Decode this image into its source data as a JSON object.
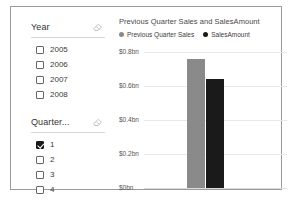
{
  "report": {
    "frame_border_color": "#9b9b9b",
    "background": "#ffffff"
  },
  "slicers": [
    {
      "id": "year-slicer",
      "title": "Year",
      "clear_icon": "eraser-icon",
      "items": [
        {
          "label": "2005",
          "checked": false
        },
        {
          "label": "2006",
          "checked": false
        },
        {
          "label": "2007",
          "checked": false
        },
        {
          "label": "2008",
          "checked": false
        }
      ]
    },
    {
      "id": "quarter-slicer",
      "title": "Quarter...",
      "clear_icon": "eraser-icon",
      "items": [
        {
          "label": "1",
          "checked": true
        },
        {
          "label": "2",
          "checked": false
        },
        {
          "label": "3",
          "checked": false
        },
        {
          "label": "4",
          "checked": false
        }
      ]
    }
  ],
  "chart_data": {
    "type": "bar",
    "title": "Previous Quarter Sales and SalesAmount",
    "xlabel": "",
    "ylabel": "",
    "categories": [
      ""
    ],
    "series": [
      {
        "name": "Previous Quarter Sales",
        "values": [
          0.76
        ],
        "color": "#8a8a8a"
      },
      {
        "name": "SalesAmount",
        "values": [
          0.645
        ],
        "color": "#1a1a1a"
      }
    ],
    "ylim": [
      0,
      0.85
    ],
    "yticks": [
      0.8,
      0.6,
      0.4,
      0.2,
      0
    ],
    "ytick_labels": [
      "$0.8bn",
      "$0.6bn",
      "$0.4bn",
      "$0.2bn",
      "$0bn"
    ],
    "grid": true,
    "legend": "top-left",
    "legend_entries": [
      {
        "label": "Previous Quarter Sales",
        "color": "#8a8a8a"
      },
      {
        "label": "SalesAmount",
        "color": "#1a1a1a"
      }
    ]
  }
}
